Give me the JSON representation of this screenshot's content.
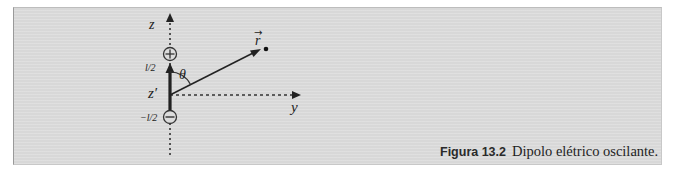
{
  "figure": {
    "caption_label": "Figura 13.2",
    "caption_text": "Dipolo elétrico oscilante."
  },
  "diagram": {
    "axis_z_label": "z",
    "axis_y_label": "y",
    "vector_label": "r",
    "vector_arrow_accent": "→",
    "angle_label": "θ",
    "position_label": "z′",
    "upper_tick_label": "l/2",
    "lower_tick_label": "−l/2",
    "positive_charge": "+",
    "negative_charge": "−",
    "colors": {
      "panel_background": "#dcdcdc",
      "ink": "#222222"
    }
  }
}
